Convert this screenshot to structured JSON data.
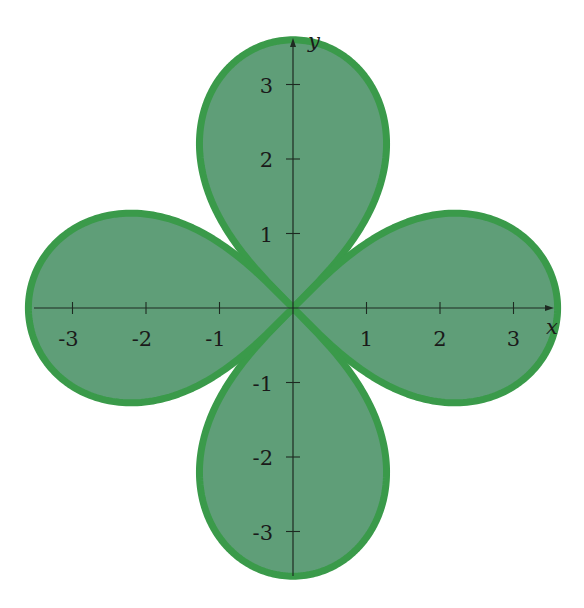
{
  "chart_data": {
    "type": "area",
    "title": "",
    "xlabel": "x",
    "ylabel": "y",
    "xlim": [
      -3.6,
      3.6
    ],
    "ylim": [
      -3.6,
      3.6
    ],
    "grid": false,
    "x_ticks": [
      -3,
      -2,
      -1,
      1,
      2,
      3
    ],
    "x_tick_labels": [
      "-3",
      "-2",
      "-1",
      "1",
      "2",
      "3"
    ],
    "y_ticks": [
      3,
      2,
      1,
      -1,
      -2,
      -3
    ],
    "y_tick_labels": [
      "3",
      "2",
      "1",
      "-1",
      "-2",
      "-3"
    ],
    "leaves": [
      {
        "name": "top",
        "direction_deg": 90,
        "tip": [
          0,
          3.6
        ],
        "half_width": 1.3
      },
      {
        "name": "right",
        "direction_deg": 0,
        "tip": [
          3.6,
          0
        ],
        "half_width": 1.3
      },
      {
        "name": "bottom",
        "direction_deg": 270,
        "tip": [
          0,
          -3.6
        ],
        "half_width": 1.3
      },
      {
        "name": "left",
        "direction_deg": 180,
        "tip": [
          -3.6,
          0
        ],
        "half_width": 1.3
      }
    ],
    "leaf_max_radius": 3.6,
    "colors": {
      "fill": "#5f9e78",
      "stroke": "#3a9a4a",
      "axis": "#1e2a22"
    }
  },
  "layout": {
    "origin_px": [
      293,
      308
    ],
    "x_unit_px": 73.5,
    "y_unit_px": 74.5
  }
}
